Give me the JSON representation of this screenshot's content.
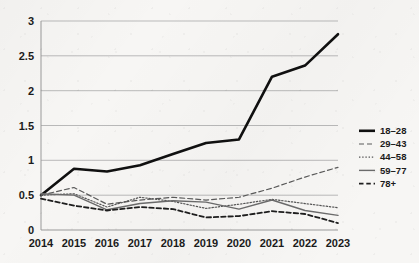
{
  "chart_data": {
    "type": "line",
    "title": "",
    "subtitle": "",
    "xlabel": "",
    "ylabel": "",
    "x": [
      2014,
      2015,
      2016,
      2017,
      2018,
      2019,
      2020,
      2021,
      2022,
      2023
    ],
    "categories": [
      "2014",
      "2015",
      "2016",
      "2017",
      "2018",
      "2019",
      "2020",
      "2021",
      "2022",
      "2023"
    ],
    "xlim": [
      2014,
      2023
    ],
    "ylim": [
      0,
      3
    ],
    "yticks": [
      0,
      0.5,
      1,
      1.5,
      2,
      2.5,
      3
    ],
    "ytick_labels": [
      "0",
      "0.5",
      "1",
      "1.5",
      "2",
      "2.5",
      "3"
    ],
    "grid": "horizontal",
    "legend_position": "right",
    "series": [
      {
        "name": "18–28",
        "style": "solid-thick",
        "color": "#101010",
        "values": [
          0.5,
          0.88,
          0.84,
          0.93,
          1.09,
          1.25,
          1.3,
          2.2,
          2.36,
          2.81
        ]
      },
      {
        "name": "29–43",
        "style": "dashed",
        "color": "#5a5a5a",
        "values": [
          0.5,
          0.61,
          0.37,
          0.43,
          0.47,
          0.43,
          0.47,
          0.6,
          0.76,
          0.9
        ]
      },
      {
        "name": "44–58",
        "style": "dotted",
        "color": "#555555",
        "values": [
          0.5,
          0.52,
          0.33,
          0.47,
          0.41,
          0.31,
          0.37,
          0.44,
          0.38,
          0.32
        ]
      },
      {
        "name": "59–77",
        "style": "solid-thin",
        "color": "#6b6b6b",
        "values": [
          0.52,
          0.5,
          0.29,
          0.38,
          0.42,
          0.4,
          0.3,
          0.43,
          0.28,
          0.21
        ]
      },
      {
        "name": "78+",
        "style": "dashed-bold",
        "color": "#1e1e1e",
        "values": [
          0.45,
          0.35,
          0.28,
          0.33,
          0.3,
          0.18,
          0.2,
          0.27,
          0.23,
          0.1
        ]
      }
    ]
  },
  "axes": {
    "x_tick_labels": [
      "2014",
      "2015",
      "2016",
      "2017",
      "2018",
      "2019",
      "2020",
      "2021",
      "2022",
      "2023"
    ],
    "y_tick_labels": [
      "3",
      "2.5",
      "2",
      "1.5",
      "1",
      "0.5",
      "0"
    ]
  },
  "legend": {
    "entries": [
      {
        "label": "18–28"
      },
      {
        "label": "29–43"
      },
      {
        "label": "44–58"
      },
      {
        "label": "59–77"
      },
      {
        "label": "78+"
      }
    ]
  },
  "colors": {
    "background": "#f7f6f4",
    "grid": "#b9b9b9",
    "axis": "#8f8f8f",
    "text": "#1b1b1b",
    "primary_series": "#101010"
  }
}
